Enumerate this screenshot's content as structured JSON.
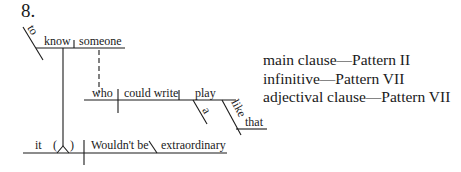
{
  "exercise_number": "8.",
  "diagram": {
    "words": {
      "to": "to",
      "know": "know",
      "someone": "someone",
      "who": "who",
      "could_write": "could write",
      "play": "play",
      "a": "a",
      "like": "like",
      "that": "that",
      "it": "it",
      "paren_open": "(",
      "paren_close": ")",
      "wouldnt_be": "Wouldn't be",
      "extraordinary": "extraordinary"
    }
  },
  "legend": {
    "lines": [
      "main clause—Pattern II",
      "infinitive—Pattern VII",
      "adjectival clause—Pattern VII"
    ]
  }
}
